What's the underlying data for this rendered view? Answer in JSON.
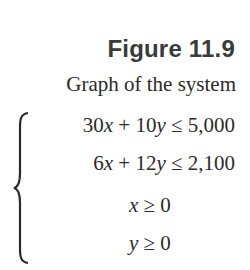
{
  "figure": {
    "label": "Figure 11.9",
    "caption": "Graph of the system"
  },
  "system": {
    "inequalities": [
      {
        "coef_x": "30",
        "var_x": "x",
        "op1": " + ",
        "coef_y": "10",
        "var_y": "y",
        "relation": " ≤ ",
        "rhs": "5,000"
      },
      {
        "coef_x": "6",
        "var_x": "x",
        "op1": " + ",
        "coef_y": "12",
        "var_y": "y",
        "relation": " ≤ ",
        "rhs": "2,100"
      },
      {
        "var": "x",
        "relation": " ≥ ",
        "rhs": "0"
      },
      {
        "var": "y",
        "relation": " ≥ ",
        "rhs": "0"
      }
    ]
  }
}
